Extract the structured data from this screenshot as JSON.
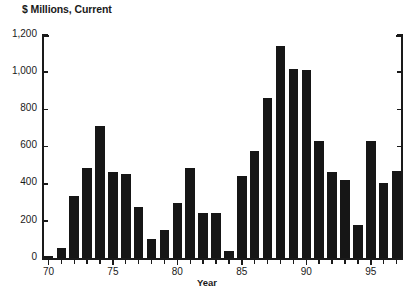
{
  "chart_data": {
    "type": "bar",
    "title": "",
    "ylabel": "$ Millions, Current",
    "xlabel": "Year",
    "ylim": [
      0,
      1200
    ],
    "yticks": [
      0,
      200,
      400,
      600,
      800,
      1000,
      1200
    ],
    "ytick_labels": [
      "0",
      "200",
      "400",
      "600",
      "800",
      "1,000",
      "1,200"
    ],
    "xlim": [
      69.5,
      97.5
    ],
    "xticks": [
      70,
      75,
      80,
      85,
      90,
      95
    ],
    "xtick_labels": [
      "70",
      "75",
      "80",
      "85",
      "90",
      "95"
    ],
    "grid": false,
    "legend": null,
    "bar_color": "#161616",
    "categories": [
      "70",
      "71",
      "72",
      "73",
      "74",
      "75",
      "76",
      "77",
      "78",
      "79",
      "80",
      "81",
      "82",
      "83",
      "84",
      "85",
      "86",
      "87",
      "88",
      "89",
      "90",
      "91",
      "92",
      "93",
      "94",
      "95",
      "96",
      "97"
    ],
    "values": [
      15,
      55,
      335,
      485,
      710,
      465,
      455,
      275,
      105,
      150,
      300,
      485,
      245,
      245,
      40,
      445,
      575,
      860,
      1140,
      1020,
      1010,
      630,
      465,
      420,
      180,
      630,
      405,
      470
    ]
  },
  "axis": {
    "ylabel_caption": "$ Millions, Current",
    "xlabel_caption": "Year"
  }
}
